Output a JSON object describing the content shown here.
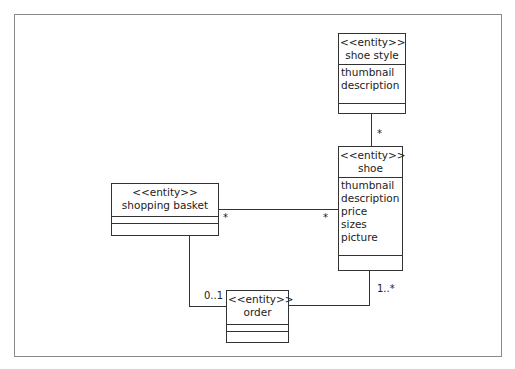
{
  "entities": {
    "shoe_style": {
      "stereotype": "<<entity>>",
      "name": "shoe style",
      "attributes": [
        "thumbnail",
        "description"
      ]
    },
    "shoe": {
      "stereotype": "<<entity>>",
      "name": "shoe",
      "attributes": [
        "thumbnail",
        "description",
        "price",
        "sizes",
        "picture"
      ]
    },
    "shopping_basket": {
      "stereotype": "<<entity>>",
      "name": "shopping basket"
    },
    "order": {
      "stereotype": "<<entity>>",
      "name": "order"
    }
  },
  "multiplicities": {
    "style_shoe": "*",
    "basket_side": "*",
    "shoe_basket_side": "*",
    "basket_order": "0..1",
    "shoe_order": "1..*"
  }
}
